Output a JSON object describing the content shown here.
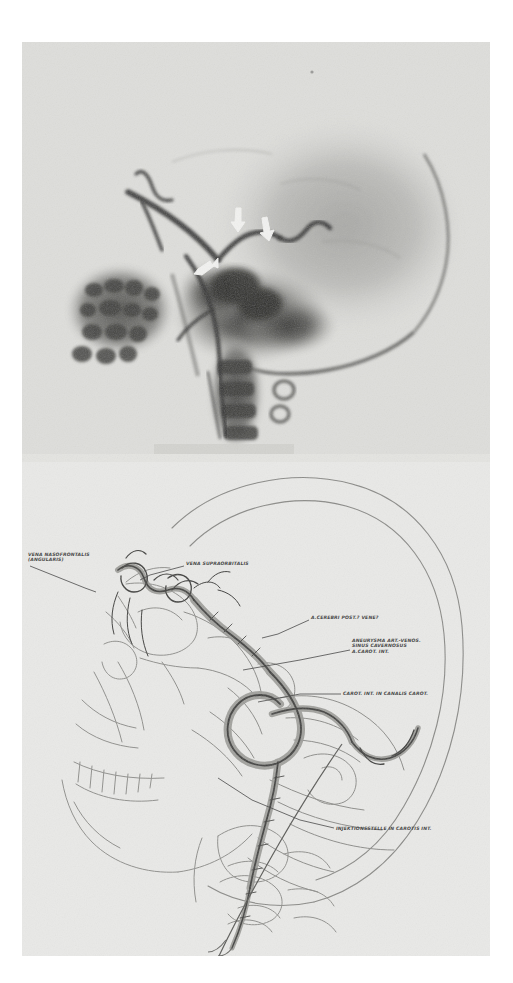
{
  "figure": {
    "kind": "medical-figure-plate",
    "background_color": "#e8e8e6",
    "panels": [
      {
        "id": "angiogram",
        "name": "lateral-carotid-angiogram",
        "caption": "",
        "markers": [
          {
            "id": "arrow-1",
            "label": "arrow",
            "x": 218,
            "y": 178,
            "angle": 115
          },
          {
            "id": "arrow-2",
            "label": "arrow",
            "x": 244,
            "y": 190,
            "angle": 125
          },
          {
            "id": "arrow-3",
            "label": "arrow",
            "x": 188,
            "y": 224,
            "angle": 35
          }
        ]
      },
      {
        "id": "line-drawing",
        "name": "schematic-line-drawing-of-angiogram",
        "caption": ""
      }
    ]
  },
  "labels": [
    {
      "id": "vena-nasofrontalis",
      "lines": [
        "VENA NASOFRONTALIS",
        "(ANGULARIS)"
      ],
      "text_x": 28,
      "text_y": 556,
      "leader": [
        [
          30,
          566
        ],
        [
          85,
          588
        ],
        [
          96,
          592
        ]
      ]
    },
    {
      "id": "vena-supraorbitalis",
      "lines": [
        "VENA SUPRAORBITALIS"
      ],
      "text_x": 186,
      "text_y": 565,
      "leader": [
        [
          184,
          566
        ],
        [
          150,
          575
        ],
        [
          140,
          580
        ]
      ]
    },
    {
      "id": "a-cerebri-post",
      "lines": [
        "A.CEREBRI POST.? VENE?"
      ],
      "text_x": 311,
      "text_y": 619,
      "leader": [
        [
          309,
          620
        ],
        [
          278,
          634
        ],
        [
          262,
          638
        ]
      ]
    },
    {
      "id": "aneurysma-art-venos",
      "lines": [
        "ANEURYSMA ART.-VENOS.",
        "SINUS CAVERNOSUS",
        "A.CAROT. INT."
      ],
      "text_x": 352,
      "text_y": 642,
      "leader": [
        [
          350,
          650
        ],
        [
          300,
          660
        ],
        [
          243,
          670
        ]
      ]
    },
    {
      "id": "carotis-interna-canalis",
      "lines": [
        "CAROT. INT. IN CANALIS CAROT."
      ],
      "text_x": 343,
      "text_y": 695,
      "leader": [
        [
          341,
          694
        ],
        [
          300,
          694
        ],
        [
          258,
          702
        ]
      ]
    },
    {
      "id": "injektionsstelle",
      "lines": [
        "INJEKTIONSSTELLE IN CAROTIS INT."
      ],
      "text_x": 336,
      "text_y": 830,
      "leader": [
        [
          334,
          828
        ],
        [
          300,
          820
        ],
        [
          252,
          800
        ],
        [
          218,
          778
        ]
      ]
    }
  ],
  "colors": {
    "paper": "#e8e8e6",
    "ink": "#4a4a4a",
    "vessel_fill": "#8d8d8a",
    "vessel_stroke": "#3c3c3a",
    "bone_line": "#8f8f8c",
    "xray_dark": "#3a3a3a",
    "arrow_white": "#f2f2f0"
  }
}
